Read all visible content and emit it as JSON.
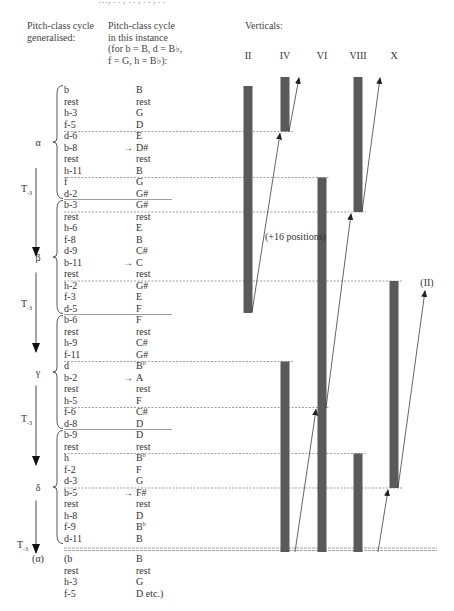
{
  "top_cut_text": "…, . . , . . , . . , . .",
  "headers": {
    "generalised": [
      "Pitch-class cycle",
      "generalised:"
    ],
    "instance": [
      "Pitch-class cycle",
      "in this instance",
      "(for b = B, d = B♭,",
      "f = G, h = B♭):"
    ],
    "verticals": "Verticals:"
  },
  "vertical_labels": [
    "II",
    "IV",
    "VI",
    "VIII",
    "X"
  ],
  "sections": [
    {
      "label": "α"
    },
    {
      "label": "β"
    },
    {
      "label": "γ"
    },
    {
      "label": "δ"
    },
    {
      "label": "(α)"
    }
  ],
  "transposition_label": "T-3",
  "rows": [
    {
      "gen": "b",
      "inst": "B"
    },
    {
      "gen": "rest",
      "inst": "rest"
    },
    {
      "gen": "h-3",
      "inst": "G"
    },
    {
      "gen": "f-5",
      "inst": "D"
    },
    {
      "gen": "d-6",
      "inst": "E"
    },
    {
      "gen": "b-8",
      "inst": "D#",
      "arrow": true
    },
    {
      "gen": "rest",
      "inst": "rest"
    },
    {
      "gen": "h-11",
      "inst": "B"
    },
    {
      "gen": "f",
      "inst": "G"
    },
    {
      "gen": "d-2",
      "inst": "G#"
    },
    {
      "gen": "b-3",
      "inst": "G#"
    },
    {
      "gen": "rest",
      "inst": "rest"
    },
    {
      "gen": "h-6",
      "inst": "E"
    },
    {
      "gen": "f-8",
      "inst": "B"
    },
    {
      "gen": "d-9",
      "inst": "C#"
    },
    {
      "gen": "b-11",
      "inst": "C",
      "arrow": true
    },
    {
      "gen": "rest",
      "inst": "rest"
    },
    {
      "gen": "h-2",
      "inst": "G#"
    },
    {
      "gen": "f-3",
      "inst": "E"
    },
    {
      "gen": "d-5",
      "inst": "F"
    },
    {
      "gen": "b-6",
      "inst": "F"
    },
    {
      "gen": "rest",
      "inst": "rest"
    },
    {
      "gen": "h-9",
      "inst": "C#"
    },
    {
      "gen": "f-11",
      "inst": "G#"
    },
    {
      "gen": "d",
      "inst": "B♭"
    },
    {
      "gen": "b-2",
      "inst": "A",
      "arrow": true
    },
    {
      "gen": "rest",
      "inst": "rest"
    },
    {
      "gen": "h-5",
      "inst": "F"
    },
    {
      "gen": "f-6",
      "inst": "C#"
    },
    {
      "gen": "d-8",
      "inst": "D"
    },
    {
      "gen": "b-9",
      "inst": "D"
    },
    {
      "gen": "rest",
      "inst": "rest"
    },
    {
      "gen": "h",
      "inst": "B♭"
    },
    {
      "gen": "f-2",
      "inst": "F"
    },
    {
      "gen": "d-3",
      "inst": "G"
    },
    {
      "gen": "b-5",
      "inst": "F#",
      "arrow": true
    },
    {
      "gen": "rest",
      "inst": "rest"
    },
    {
      "gen": "h-8",
      "inst": "D"
    },
    {
      "gen": "f-9",
      "inst": "B♭"
    },
    {
      "gen": "d-11",
      "inst": "B"
    }
  ],
  "repeat_rows": [
    {
      "gen": "(b",
      "inst": "B"
    },
    {
      "gen": "rest",
      "inst": "rest"
    },
    {
      "gen": "h-3",
      "inst": "G"
    },
    {
      "gen": "f-5",
      "inst": "D etc.)"
    }
  ],
  "annotations": {
    "positions": "(+16 positions)",
    "return": "(II)"
  },
  "colors": {
    "bar": "#5a5a5a",
    "text": "#333333",
    "dashed": "#777777"
  }
}
